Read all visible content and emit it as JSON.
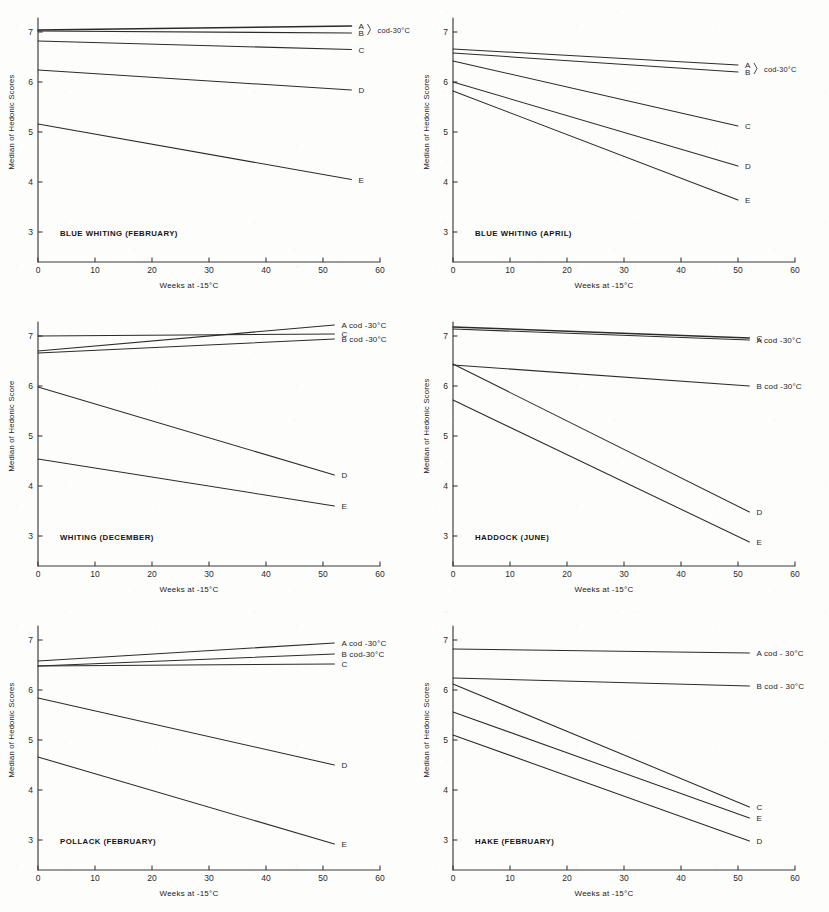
{
  "figure": {
    "background_color": "#fdfdfc",
    "ink_color": "#2b2b2b",
    "axis_color": "#3a3a3a"
  },
  "common": {
    "xlabel": "Weeks at -15°C",
    "xticks": [
      "0",
      "10",
      "20",
      "30",
      "40",
      "50",
      "60"
    ],
    "xlim": [
      0,
      60
    ],
    "yticks": [
      "3",
      "4",
      "5",
      "6",
      "7"
    ],
    "ylim": [
      2.55,
      7.45
    ],
    "cod_note": "cod-30°C"
  },
  "chart_data": [
    {
      "id": "blue-whiting-february",
      "type": "line",
      "title": "BLUE WHITING (FEBRUARY)",
      "xlabel": "Weeks at -15°C",
      "ylabel": "Median of Hedonic Scores",
      "xlim": [
        0,
        60
      ],
      "ylim": [
        2.55,
        7.45
      ],
      "xticks": [
        0,
        10,
        20,
        30,
        40,
        50,
        60
      ],
      "yticks": [
        3,
        4,
        5,
        6,
        7
      ],
      "grid": false,
      "legend_position": "right-of-line-end",
      "group_annotation": "cod-30°C",
      "group_members": [
        "A",
        "B"
      ],
      "series": [
        {
          "name": "A",
          "label": "A",
          "x": [
            0,
            55
          ],
          "values": [
            7.04,
            7.12
          ],
          "weight": "heavy"
        },
        {
          "name": "B",
          "label": "B",
          "x": [
            0,
            55
          ],
          "values": [
            7.02,
            6.98
          ],
          "weight": "normal"
        },
        {
          "name": "C",
          "label": "C",
          "x": [
            0,
            55
          ],
          "values": [
            6.82,
            6.65
          ],
          "weight": "normal"
        },
        {
          "name": "D",
          "label": "D",
          "x": [
            0,
            55
          ],
          "values": [
            6.24,
            5.84
          ],
          "weight": "normal"
        },
        {
          "name": "E",
          "label": "E",
          "x": [
            0,
            55
          ],
          "values": [
            5.16,
            4.05
          ],
          "weight": "normal"
        }
      ]
    },
    {
      "id": "blue-whiting-april",
      "type": "line",
      "title": "BLUE WHITING   (APRIL)",
      "xlabel": "Weeks at -15°C",
      "ylabel": "Median of Hedonic Scores",
      "xlim": [
        0,
        60
      ],
      "ylim": [
        2.55,
        7.45
      ],
      "xticks": [
        0,
        10,
        20,
        30,
        40,
        50,
        60
      ],
      "yticks": [
        3,
        4,
        5,
        6,
        7
      ],
      "grid": false,
      "legend_position": "right-of-line-end",
      "group_annotation": "cod-30°C",
      "group_members": [
        "A",
        "B"
      ],
      "series": [
        {
          "name": "A",
          "label": "A",
          "x": [
            0,
            50
          ],
          "values": [
            6.66,
            6.34
          ],
          "weight": "normal"
        },
        {
          "name": "B",
          "label": "B",
          "x": [
            0,
            50
          ],
          "values": [
            6.58,
            6.2
          ],
          "weight": "normal"
        },
        {
          "name": "C",
          "label": "C",
          "x": [
            0,
            50
          ],
          "values": [
            6.42,
            5.12
          ],
          "weight": "normal"
        },
        {
          "name": "D",
          "label": "D",
          "x": [
            0,
            50
          ],
          "values": [
            6.0,
            4.32
          ],
          "weight": "normal"
        },
        {
          "name": "E",
          "label": "E",
          "x": [
            0,
            50
          ],
          "values": [
            5.82,
            3.64
          ],
          "weight": "normal"
        }
      ]
    },
    {
      "id": "whiting-december",
      "type": "line",
      "title": "WHITING (DECEMBER)",
      "xlabel": "Weeks at -15°C",
      "ylabel": "Median of Hedonic Score",
      "xlim": [
        0,
        60
      ],
      "ylim": [
        2.55,
        7.45
      ],
      "xticks": [
        0,
        10,
        20,
        30,
        40,
        50,
        60
      ],
      "yticks": [
        3,
        4,
        5,
        6,
        7
      ],
      "grid": false,
      "legend_position": "right-of-line-end",
      "series": [
        {
          "name": "A",
          "label": "A cod -30°C",
          "x": [
            0,
            52
          ],
          "values": [
            6.7,
            7.22
          ],
          "weight": "normal"
        },
        {
          "name": "C",
          "label": "C",
          "x": [
            0,
            52
          ],
          "values": [
            7.0,
            7.04
          ],
          "weight": "normal"
        },
        {
          "name": "B",
          "label": "B cod -30°C",
          "x": [
            0,
            52
          ],
          "values": [
            6.66,
            6.94
          ],
          "weight": "normal"
        },
        {
          "name": "D",
          "label": "D",
          "x": [
            0,
            52
          ],
          "values": [
            5.98,
            4.22
          ],
          "weight": "normal"
        },
        {
          "name": "E",
          "label": "E",
          "x": [
            0,
            52
          ],
          "values": [
            4.54,
            3.6
          ],
          "weight": "normal"
        }
      ]
    },
    {
      "id": "haddock-june",
      "type": "line",
      "title": "HADDOCK (JUNE)",
      "xlabel": "Weeks at -15°C",
      "ylabel": "Median of Hedonic Scores",
      "xlim": [
        0,
        60
      ],
      "ylim": [
        2.55,
        7.45
      ],
      "xticks": [
        0,
        10,
        20,
        30,
        40,
        50,
        60
      ],
      "yticks": [
        3,
        4,
        5,
        6,
        7
      ],
      "grid": false,
      "legend_position": "right-of-line-end",
      "series": [
        {
          "name": "C",
          "label": "C",
          "x": [
            0,
            52
          ],
          "values": [
            7.18,
            6.96
          ],
          "weight": "heavy"
        },
        {
          "name": "A",
          "label": "A cod -30°C",
          "x": [
            0,
            52
          ],
          "values": [
            7.14,
            6.92
          ],
          "weight": "normal"
        },
        {
          "name": "B",
          "label": "B cod -30°C",
          "x": [
            0,
            52
          ],
          "values": [
            6.42,
            6.0
          ],
          "weight": "normal"
        },
        {
          "name": "D",
          "label": "D",
          "x": [
            0,
            52
          ],
          "values": [
            6.44,
            3.48
          ],
          "weight": "normal"
        },
        {
          "name": "E",
          "label": "E",
          "x": [
            0,
            52
          ],
          "values": [
            5.72,
            2.88
          ],
          "weight": "normal"
        }
      ]
    },
    {
      "id": "pollack-february",
      "type": "line",
      "title": "POLLACK (FEBRUARY)",
      "xlabel": "Weeks at -15°C",
      "ylabel": "Median of Hedonic Scores",
      "xlim": [
        0,
        60
      ],
      "ylim": [
        2.55,
        7.45
      ],
      "xticks": [
        0,
        10,
        20,
        30,
        40,
        50,
        60
      ],
      "yticks": [
        3,
        4,
        5,
        6,
        7
      ],
      "grid": false,
      "legend_position": "right-of-line-end",
      "series": [
        {
          "name": "A",
          "label": "A cod -30°C",
          "x": [
            0,
            52
          ],
          "values": [
            6.58,
            6.94
          ],
          "weight": "normal"
        },
        {
          "name": "B",
          "label": "B cod-30°C",
          "x": [
            0,
            52
          ],
          "values": [
            6.48,
            6.72
          ],
          "weight": "normal"
        },
        {
          "name": "C",
          "label": "C",
          "x": [
            0,
            52
          ],
          "values": [
            6.48,
            6.52
          ],
          "weight": "normal"
        },
        {
          "name": "D",
          "label": "D",
          "x": [
            0,
            52
          ],
          "values": [
            5.84,
            4.5
          ],
          "weight": "normal"
        },
        {
          "name": "E",
          "label": "E",
          "x": [
            0,
            52
          ],
          "values": [
            4.66,
            2.92
          ],
          "weight": "normal"
        }
      ]
    },
    {
      "id": "hake-february",
      "type": "line",
      "title": "HAKE (FEBRUARY)",
      "xlabel": "Weeks at -15°C",
      "ylabel": "Median of Hedonic Scores",
      "xlim": [
        0,
        60
      ],
      "ylim": [
        2.55,
        7.45
      ],
      "xticks": [
        0,
        10,
        20,
        30,
        40,
        50,
        60
      ],
      "yticks": [
        3,
        4,
        5,
        6,
        7
      ],
      "grid": false,
      "legend_position": "right-of-line-end",
      "series": [
        {
          "name": "A",
          "label": "A cod - 30°C",
          "x": [
            0,
            52
          ],
          "values": [
            6.82,
            6.74
          ],
          "weight": "normal"
        },
        {
          "name": "B",
          "label": "B cod - 30°C",
          "x": [
            0,
            52
          ],
          "values": [
            6.24,
            6.08
          ],
          "weight": "normal"
        },
        {
          "name": "C",
          "label": "C",
          "x": [
            0,
            52
          ],
          "values": [
            6.12,
            3.66
          ],
          "weight": "normal"
        },
        {
          "name": "E",
          "label": "E",
          "x": [
            0,
            52
          ],
          "values": [
            5.56,
            3.44
          ],
          "weight": "normal"
        },
        {
          "name": "D",
          "label": "D",
          "x": [
            0,
            52
          ],
          "values": [
            5.1,
            2.98
          ],
          "weight": "normal"
        }
      ]
    }
  ],
  "panels": [
    {
      "key": "blue-whiting-february",
      "left": 0,
      "top": 0
    },
    {
      "key": "blue-whiting-april",
      "left": 415,
      "top": 0
    },
    {
      "key": "whiting-december",
      "left": 0,
      "top": 304
    },
    {
      "key": "haddock-june",
      "left": 415,
      "top": 304
    },
    {
      "key": "pollack-february",
      "left": 0,
      "top": 608
    },
    {
      "key": "hake-february",
      "left": 415,
      "top": 608
    }
  ]
}
